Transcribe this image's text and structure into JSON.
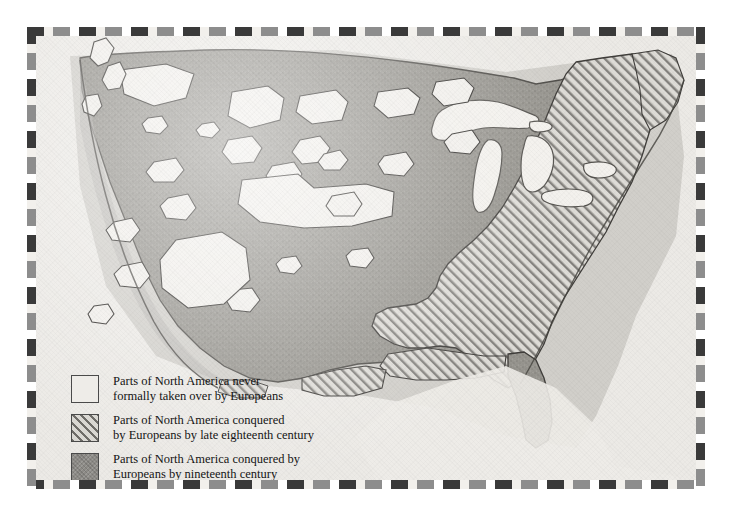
{
  "map": {
    "title": "Parts of North America conquered by Europeans",
    "region": "Continental United States",
    "style": "pencil-shaded historical map with checkered decorative border",
    "paper_color": "#eceae6",
    "frame_colors": [
      "#3a3a3a",
      "#f2f0ec",
      "#8d8d8d",
      "#ffffff"
    ]
  },
  "legend": {
    "items": [
      {
        "id": "never-taken",
        "swatch": "none",
        "swatch_style": "empty-white",
        "color": "#eeece8",
        "label": "Parts of North America never\nformally taken over by Europeans"
      },
      {
        "id": "late-eighteenth-century",
        "swatch": "hatch",
        "swatch_style": "diagonal-hatch",
        "color": "#6e6c68",
        "label": "Parts of North America conquered\nby Europeans by late eighteenth century"
      },
      {
        "id": "nineteenth-century",
        "swatch": "solid",
        "swatch_style": "solid-gray-stipple",
        "color": "#8c8a86",
        "label": "Parts of North America conquered by\nEuropeans by nineteenth century"
      }
    ]
  },
  "features": {
    "great_lakes": [
      "Superior",
      "Michigan",
      "Huron",
      "Erie",
      "Ontario"
    ],
    "enclave_count": 24,
    "hatched_region": "eastern seaboard and southeast",
    "solid_region": "western, plains and midwest interior"
  }
}
